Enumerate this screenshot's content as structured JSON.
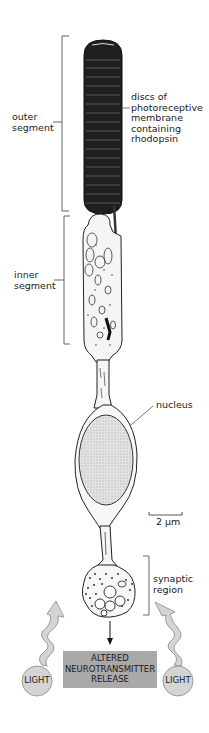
{
  "labels": {
    "outer_segment": [
      "outer",
      "segment"
    ],
    "discs": [
      "discs of",
      "photoreceptive",
      "membrane",
      "containing",
      "rhodopsin"
    ],
    "inner_segment": [
      "inner",
      "segment"
    ],
    "nucleus": "nucleus",
    "scale_bar": "2 µm",
    "synaptic_region": [
      "synaptic",
      "region"
    ]
  },
  "output_box": {
    "lines": [
      "ALTERED",
      "NEUROTRANSMITTER",
      "RELEASE"
    ],
    "fill": "#a9a9a9"
  },
  "light_left": {
    "label": "LIGHT",
    "fill": "#d4d4d4"
  },
  "light_right": {
    "label": "LIGHT",
    "fill": "#d4d4d4"
  },
  "colors": {
    "ink": "#1a1a1a",
    "bracket": "#555555",
    "outer_segment": "#222222",
    "nucleus_fill": "#e8e8e8",
    "cell_fill": "#f7f7f7"
  }
}
